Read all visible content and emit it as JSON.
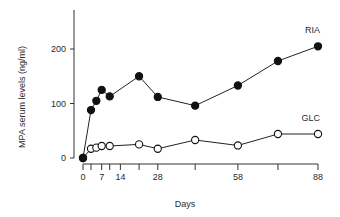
{
  "chart_data": {
    "type": "line",
    "title": "",
    "xlabel": "Days",
    "ylabel": "MPA serum levels (ng/ml)",
    "xlim": [
      0,
      88
    ],
    "ylim": [
      0,
      260
    ],
    "x_tick_labels": [
      0,
      7,
      14,
      28,
      58,
      88
    ],
    "x_minor_ticks": [
      3,
      10,
      21,
      42,
      73
    ],
    "y_tick_labels": [
      0,
      100,
      200
    ],
    "grid": false,
    "legend": "inline labels at right end of each series",
    "series": [
      {
        "name": "RIA",
        "marker": "filled-circle",
        "x": [
          0,
          3,
          5,
          7,
          10,
          21,
          28,
          42,
          58,
          73,
          88
        ],
        "values": [
          0,
          88,
          105,
          125,
          113,
          150,
          112,
          96,
          133,
          178,
          205
        ]
      },
      {
        "name": "GLC",
        "marker": "open-circle",
        "x": [
          0,
          3,
          5,
          7,
          10,
          21,
          28,
          42,
          58,
          73,
          88
        ],
        "values": [
          0,
          17,
          19,
          22,
          22,
          25,
          17,
          33,
          23,
          44,
          44
        ]
      }
    ]
  }
}
